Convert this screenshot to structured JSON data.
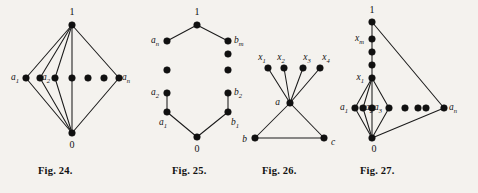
{
  "plate": {
    "background_color": "#f4f2ee",
    "ink_color": "#111111",
    "width": 478,
    "height": 193
  },
  "figures": [
    {
      "id": "fig-24",
      "caption": "Fig. 24.",
      "description": "Hasse diagram of a lattice of length two: top element 1, bottom element 0, and a horizontal row of n atoms a1, a2, ..., an.",
      "top_label": "1",
      "bottom_label": "0",
      "atom_labels": [
        "a",
        "1",
        "a",
        "2",
        "a",
        "n"
      ],
      "atom_count_drawn": 7,
      "labels": {
        "top": "1",
        "bottom": "0",
        "first_atom_base": "a",
        "first_atom_sub": "1",
        "second_atom_base": "a",
        "second_atom_sub": "2",
        "last_atom_base": "a",
        "last_atom_sub": "n"
      }
    },
    {
      "id": "fig-25",
      "caption": "Fig. 25.",
      "description": "Hasse diagram of the direct union of two chains: top 1, bottom 0, left chain a1..an, right chain b1..bm.",
      "labels": {
        "top": "1",
        "bottom": "0",
        "left_top_base": "a",
        "left_top_sub": "n",
        "left_mid_base": "a",
        "left_mid_sub": "2",
        "left_bottom_base": "a",
        "left_bottom_sub": "1",
        "right_top_base": "b",
        "right_top_sub": "m",
        "right_mid_base": "b",
        "right_mid_sub": "2",
        "right_bottom_base": "b",
        "right_bottom_sub": "1"
      }
    },
    {
      "id": "fig-26",
      "caption": "Fig. 26.",
      "description": "Graph with a central vertex a joined to four vertices x1, x2, x3, x4 above, and to b and c below which form a triangle with a.",
      "labels": {
        "center": "a",
        "lower_left": "b",
        "lower_right": "c",
        "x1_base": "x",
        "x1_sub": "1",
        "x2_base": "x",
        "x2_sub": "2",
        "x3_base": "x",
        "x3_sub": "3",
        "x4_base": "x",
        "x4_sub": "4"
      }
    },
    {
      "id": "fig-27",
      "caption": "Fig. 27.",
      "description": "Hasse diagram with top 1, a vertical chain x1..xm below it, bottom 0, and a horizontal row of atoms a1, a2, a3, ..., an.",
      "labels": {
        "top": "1",
        "bottom": "0",
        "chain_top_base": "x",
        "chain_top_sub": "m",
        "chain_bottom_base": "x",
        "chain_bottom_sub": "1",
        "a1_base": "a",
        "a1_sub": "1",
        "a2_base": "a",
        "a2_sub": "2",
        "a3_base": "a",
        "a3_sub": "3",
        "an_base": "a",
        "an_sub": "n"
      }
    }
  ]
}
